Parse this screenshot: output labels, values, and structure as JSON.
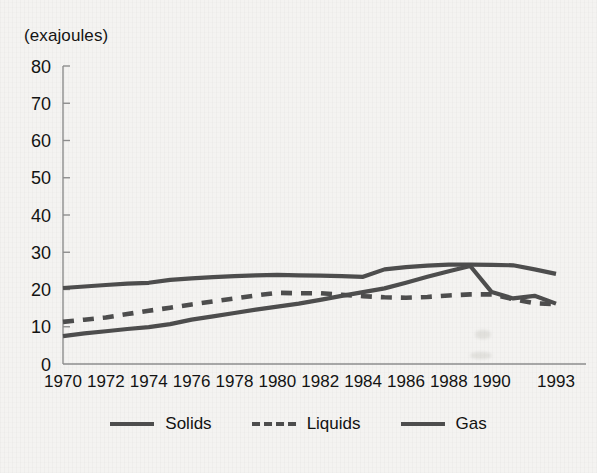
{
  "axis_unit_label": "(exajoules)",
  "colors": {
    "background": "#f4f3f1",
    "line": "#4d4d4d",
    "axis": "#8d8d8d",
    "text": "#131313"
  },
  "legend": {
    "items": [
      {
        "label": "Solids",
        "style": "solid"
      },
      {
        "label": "Liquids",
        "style": "dashed"
      },
      {
        "label": "Gas",
        "style": "solid"
      }
    ]
  },
  "chart_data": {
    "type": "line",
    "title": "",
    "subtitle": "",
    "xlabel": "",
    "ylabel": "(exajoules)",
    "ylim": [
      0,
      80
    ],
    "ytick_values": [
      0,
      10,
      20,
      30,
      40,
      50,
      60,
      70,
      80
    ],
    "ytick_labels": [
      "0",
      "10",
      "20",
      "30",
      "40",
      "50",
      "60",
      "70",
      "80"
    ],
    "grid": false,
    "legend_position": "bottom",
    "x": [
      1970,
      1971,
      1972,
      1973,
      1974,
      1975,
      1976,
      1977,
      1978,
      1979,
      1980,
      1981,
      1982,
      1983,
      1984,
      1985,
      1986,
      1987,
      1988,
      1989,
      1990,
      1991,
      1992,
      1993
    ],
    "xtick_values": [
      1970,
      1972,
      1974,
      1976,
      1978,
      1980,
      1982,
      1984,
      1986,
      1988,
      1990,
      1993
    ],
    "xtick_labels": [
      "1970",
      "1972",
      "1974",
      "1976",
      "1978",
      "1980",
      "1982",
      "1984",
      "1986",
      "1988",
      "1990",
      "1993"
    ],
    "series": [
      {
        "name": "Solids",
        "style": "solid",
        "values": [
          20.4,
          20.8,
          21.2,
          21.6,
          21.8,
          22.6,
          23.0,
          23.3,
          23.6,
          23.8,
          23.9,
          23.8,
          23.7,
          23.6,
          23.4,
          25.4,
          26.0,
          26.4,
          26.7,
          26.7,
          26.6,
          26.5,
          25.4,
          24.2
        ]
      },
      {
        "name": "Liquids",
        "style": "dashed",
        "values": [
          11.3,
          11.9,
          12.5,
          13.4,
          14.3,
          15.1,
          16.0,
          16.8,
          17.6,
          18.4,
          19.1,
          19.0,
          19.0,
          18.6,
          18.2,
          17.9,
          17.8,
          18.0,
          18.4,
          18.7,
          18.7,
          17.4,
          16.3,
          16.1
        ]
      },
      {
        "name": "Gas",
        "style": "solid",
        "values": [
          7.5,
          8.2,
          8.8,
          9.4,
          9.9,
          10.7,
          11.9,
          12.8,
          13.7,
          14.6,
          15.4,
          16.2,
          17.2,
          18.3,
          19.3,
          20.3,
          21.8,
          23.4,
          24.9,
          26.3,
          19.3,
          17.6,
          18.3,
          16.2
        ]
      }
    ]
  }
}
